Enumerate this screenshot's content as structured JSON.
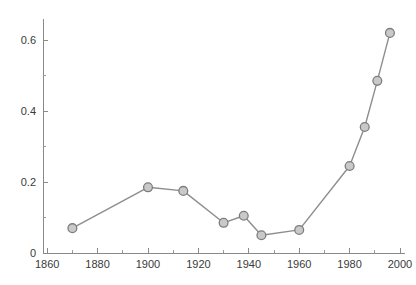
{
  "chart_data": {
    "type": "line",
    "title": "",
    "subtitle": "",
    "xlabel": "",
    "ylabel": "",
    "x": [
      1870,
      1900,
      1914,
      1930,
      1938,
      1945,
      1960,
      1980,
      1986,
      1991,
      1996
    ],
    "values": [
      0.07,
      0.185,
      0.175,
      0.085,
      0.105,
      0.05,
      0.065,
      0.245,
      0.355,
      0.485,
      0.62
    ],
    "series": [
      {
        "name": "",
        "values": [
          0.07,
          0.185,
          0.175,
          0.085,
          0.105,
          0.05,
          0.065,
          0.245,
          0.355,
          0.485,
          0.62
        ]
      }
    ],
    "xlim": [
      1858,
      2003
    ],
    "ylim": [
      0,
      0.66
    ],
    "x_ticks": [
      1860,
      1880,
      1900,
      1920,
      1940,
      1960,
      1980,
      2000
    ],
    "x_tick_labels": [
      "1860",
      "1880",
      "1900",
      "1920",
      "1940",
      "1960",
      "1980",
      "2000"
    ],
    "x_minor_ticks": [
      1870,
      1890,
      1910,
      1930,
      1950,
      1970,
      1990
    ],
    "y_ticks": [
      0,
      0.2,
      0.4,
      0.6
    ],
    "y_tick_labels": [
      "0",
      "0.2",
      "0.4",
      "0.6"
    ],
    "y_minor_ticks": [
      0.1,
      0.3,
      0.5
    ],
    "grid": false,
    "legend": null,
    "legend_position": "none",
    "marker": "circle",
    "colors": {
      "line": "#8d8d8d",
      "marker_fill": "#c9c9c9",
      "marker_edge": "#7d7d7d",
      "axis": "#8a8a8a",
      "tick_text": "#3a3a3a",
      "background": "#ffffff"
    }
  },
  "axes": {
    "x_tick_labels": [
      "1860",
      "1880",
      "1900",
      "1920",
      "1940",
      "1960",
      "1980",
      "2000"
    ],
    "y_tick_labels": [
      "0",
      "0.2",
      "0.4",
      "0.6"
    ]
  }
}
